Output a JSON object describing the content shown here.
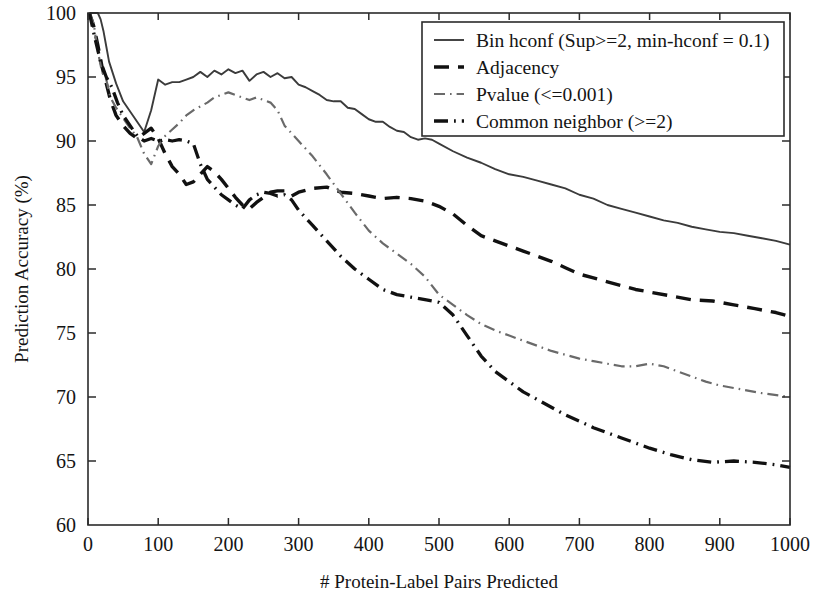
{
  "chart_data": {
    "type": "line",
    "title": "",
    "xlabel": "# Protein-Label Pairs Predicted",
    "ylabel": "Prediction Accuracy (%)",
    "xlim": [
      0,
      1000
    ],
    "ylim": [
      60,
      100
    ],
    "xticks": [
      0,
      100,
      200,
      300,
      400,
      500,
      600,
      700,
      800,
      900,
      1000
    ],
    "yticks": [
      60,
      65,
      70,
      75,
      80,
      85,
      90,
      95,
      100
    ],
    "grid": false,
    "legend_position": "top-right",
    "series": [
      {
        "name": "Bin hconf (Sup>=2, min-hconf  = 0.1)",
        "style": "solid",
        "color": "#3b3b3b",
        "x": [
          2,
          6,
          10,
          14,
          18,
          22,
          26,
          30,
          40,
          50,
          60,
          70,
          80,
          90,
          100,
          110,
          120,
          130,
          140,
          150,
          160,
          170,
          180,
          190,
          200,
          210,
          220,
          230,
          240,
          250,
          260,
          270,
          280,
          290,
          300,
          310,
          320,
          330,
          340,
          350,
          360,
          370,
          380,
          390,
          400,
          410,
          420,
          430,
          440,
          450,
          460,
          470,
          480,
          490,
          500,
          520,
          540,
          560,
          580,
          600,
          620,
          640,
          660,
          680,
          700,
          720,
          740,
          760,
          780,
          800,
          820,
          840,
          860,
          880,
          900,
          920,
          940,
          960,
          980,
          1000
        ],
        "y": [
          100,
          100,
          100,
          100,
          99.5,
          98.6,
          97.4,
          96.2,
          94.5,
          93.1,
          92.3,
          91.5,
          90.7,
          92.4,
          94.8,
          94.4,
          94.6,
          94.6,
          94.8,
          95.0,
          95.4,
          95.0,
          95.5,
          95.2,
          95.6,
          95.3,
          95.5,
          94.7,
          95.2,
          95.4,
          95.0,
          95.3,
          94.9,
          95.0,
          94.4,
          94.2,
          93.9,
          93.6,
          93.2,
          93.1,
          93.1,
          92.6,
          92.5,
          92.1,
          91.7,
          91.5,
          91.5,
          91.1,
          90.8,
          90.7,
          90.3,
          90.1,
          90.2,
          90.1,
          89.8,
          89.2,
          88.7,
          88.3,
          87.8,
          87.4,
          87.2,
          86.9,
          86.6,
          86.3,
          85.8,
          85.5,
          85.0,
          84.7,
          84.4,
          84.1,
          83.8,
          83.6,
          83.3,
          83.1,
          82.9,
          82.8,
          82.6,
          82.4,
          82.2,
          81.9
        ]
      },
      {
        "name": "Adjacency",
        "style": "dashed",
        "color": "#111111",
        "x": [
          2,
          8,
          14,
          20,
          26,
          32,
          40,
          50,
          60,
          70,
          80,
          90,
          100,
          110,
          120,
          130,
          140,
          150,
          160,
          170,
          180,
          190,
          200,
          210,
          220,
          230,
          240,
          250,
          260,
          270,
          280,
          290,
          300,
          320,
          340,
          360,
          380,
          400,
          420,
          440,
          460,
          480,
          500,
          520,
          540,
          560,
          580,
          600,
          620,
          640,
          660,
          680,
          700,
          720,
          740,
          760,
          780,
          800,
          830,
          860,
          890,
          920,
          950,
          980,
          1000
        ],
        "y": [
          100,
          99.0,
          97.5,
          95.8,
          94.5,
          93.2,
          92.0,
          91.2,
          90.6,
          90.2,
          90.6,
          91.0,
          90.2,
          89.0,
          88.0,
          87.4,
          86.6,
          86.8,
          87.4,
          88.0,
          87.6,
          87.0,
          86.3,
          85.6,
          85.0,
          84.7,
          85.2,
          85.6,
          86.0,
          86.1,
          86.1,
          85.7,
          86.0,
          86.3,
          86.4,
          86.0,
          85.9,
          85.7,
          85.5,
          85.6,
          85.5,
          85.3,
          84.9,
          84.3,
          83.4,
          82.6,
          82.2,
          81.8,
          81.4,
          81.0,
          80.6,
          80.1,
          79.6,
          79.3,
          79.0,
          78.7,
          78.4,
          78.2,
          77.9,
          77.6,
          77.5,
          77.2,
          76.9,
          76.6,
          76.3
        ]
      },
      {
        "name": "Pvalue (<=0.001)",
        "style": "dashdot-light",
        "color": "#6a6a6a",
        "x": [
          2,
          8,
          14,
          20,
          26,
          32,
          40,
          50,
          60,
          70,
          80,
          90,
          100,
          110,
          120,
          130,
          140,
          150,
          160,
          170,
          180,
          190,
          200,
          210,
          220,
          230,
          240,
          250,
          260,
          270,
          280,
          290,
          300,
          320,
          340,
          360,
          380,
          400,
          420,
          440,
          460,
          480,
          500,
          520,
          540,
          560,
          580,
          600,
          620,
          640,
          660,
          680,
          700,
          720,
          740,
          760,
          780,
          800,
          820,
          840,
          860,
          880,
          900,
          930,
          960,
          1000
        ],
        "y": [
          100,
          99.2,
          97.0,
          95.4,
          94.8,
          93.4,
          92.6,
          91.8,
          91.0,
          90.3,
          89.0,
          88.2,
          89.6,
          90.4,
          90.9,
          91.4,
          92.0,
          92.4,
          92.7,
          93.0,
          93.4,
          93.6,
          93.8,
          93.6,
          93.4,
          93.2,
          93.4,
          93.2,
          93.0,
          92.4,
          91.2,
          90.6,
          90.0,
          88.8,
          87.4,
          85.9,
          84.4,
          83.0,
          82.0,
          81.2,
          80.4,
          79.4,
          78.0,
          77.2,
          76.4,
          75.7,
          75.2,
          74.8,
          74.4,
          74.0,
          73.6,
          73.3,
          73.0,
          72.8,
          72.6,
          72.4,
          72.4,
          72.6,
          72.4,
          72.0,
          71.6,
          71.2,
          70.9,
          70.6,
          70.3,
          70.0
        ]
      },
      {
        "name": "Common neighbor (>=2)",
        "style": "dashdot-dark",
        "color": "#111111",
        "x": [
          2,
          10,
          18,
          26,
          34,
          42,
          50,
          60,
          70,
          80,
          90,
          100,
          110,
          120,
          130,
          140,
          150,
          160,
          170,
          180,
          190,
          200,
          210,
          220,
          230,
          240,
          250,
          260,
          270,
          280,
          290,
          300,
          320,
          340,
          360,
          380,
          400,
          420,
          440,
          460,
          480,
          500,
          520,
          540,
          560,
          580,
          600,
          620,
          640,
          660,
          680,
          700,
          720,
          740,
          760,
          780,
          800,
          830,
          860,
          890,
          920,
          950,
          980,
          1000
        ],
        "y": [
          100,
          98.0,
          96.2,
          95.0,
          94.2,
          93.0,
          92.0,
          91.2,
          90.4,
          90.0,
          90.2,
          90.0,
          90.1,
          90.0,
          90.1,
          90.0,
          89.8,
          88.2,
          87.0,
          86.4,
          85.8,
          85.4,
          85.0,
          84.7,
          85.4,
          85.8,
          86.0,
          85.9,
          85.7,
          85.8,
          85.4,
          84.6,
          83.4,
          82.2,
          81.0,
          80.0,
          79.2,
          78.4,
          78.0,
          77.8,
          77.6,
          77.4,
          76.4,
          74.8,
          73.2,
          72.0,
          71.2,
          70.4,
          69.8,
          69.2,
          68.6,
          68.1,
          67.6,
          67.2,
          66.8,
          66.4,
          66.0,
          65.5,
          65.1,
          64.9,
          65.0,
          64.9,
          64.7,
          64.5
        ]
      }
    ]
  },
  "axes": {
    "ylabel": "Prediction Accuracy (%)",
    "xlabel": "# Protein-Label Pairs Predicted",
    "xtick_labels": [
      "0",
      "100",
      "200",
      "300",
      "400",
      "500",
      "600",
      "700",
      "800",
      "900",
      "1000"
    ],
    "ytick_labels": [
      "60",
      "65",
      "70",
      "75",
      "80",
      "85",
      "90",
      "95",
      "100"
    ]
  },
  "legend": {
    "entries": [
      {
        "label": "Bin hconf (Sup>=2, min-hconf  = 0.1)",
        "swatch": "solid-line-swatch"
      },
      {
        "label": "Adjacency",
        "swatch": "dashed-line-swatch"
      },
      {
        "label": "Pvalue (<=0.001)",
        "swatch": "dashdot-light-line-swatch"
      },
      {
        "label": "Common neighbor (>=2)",
        "swatch": "dashdot-dark-line-swatch"
      }
    ]
  },
  "colors": {
    "series_solid": "#3b3b3b",
    "series_dashed": "#111111",
    "series_pvalue": "#6a6a6a",
    "series_common": "#111111",
    "frame": "#2b2b2b",
    "background": "#ffffff"
  }
}
